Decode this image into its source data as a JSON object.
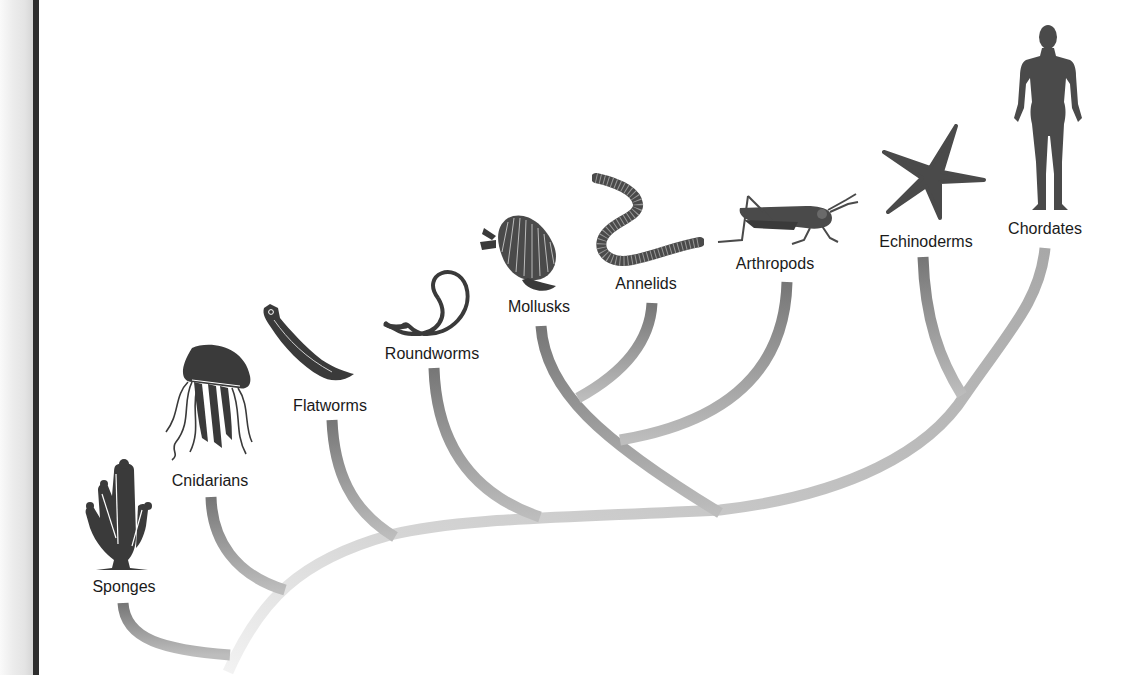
{
  "diagram": {
    "type": "phylogenetic-tree",
    "root": "animal-ancestor",
    "taxa": [
      {
        "id": "sponges",
        "label": "Sponges",
        "icon": "sponge-icon"
      },
      {
        "id": "cnidarians",
        "label": "Cnidarians",
        "icon": "jellyfish-icon"
      },
      {
        "id": "flatworms",
        "label": "Flatworms",
        "icon": "flatworm-icon"
      },
      {
        "id": "roundworms",
        "label": "Roundworms",
        "icon": "roundworm-icon"
      },
      {
        "id": "mollusks",
        "label": "Mollusks",
        "icon": "clam-icon"
      },
      {
        "id": "annelids",
        "label": "Annelids",
        "icon": "earthworm-icon"
      },
      {
        "id": "arthropods",
        "label": "Arthropods",
        "icon": "grasshopper-icon"
      },
      {
        "id": "echinoderms",
        "label": "Echinoderms",
        "icon": "starfish-icon"
      },
      {
        "id": "chordates",
        "label": "Chordates",
        "icon": "human-icon"
      }
    ],
    "topology": "(Sponges,(Cnidarians,(Flatworms,(Roundworms,((Mollusks,Annelids),Arthropods),(Echinoderms,Chordates)))))",
    "branch_color_dark": "#6f6f6f",
    "branch_color_light": "#d2d2d2",
    "icon_color": "#3a3a3a"
  }
}
